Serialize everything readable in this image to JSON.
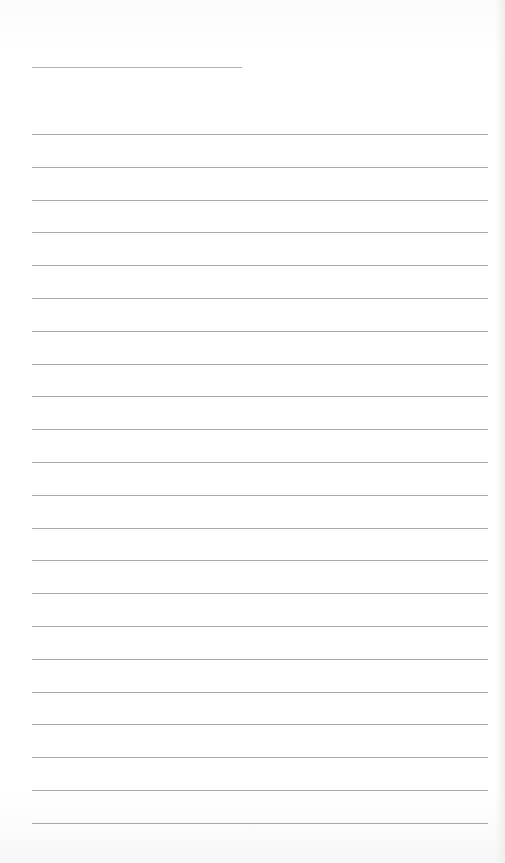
{
  "document": {
    "type": "lined-paper",
    "header_line": {
      "x": 32,
      "y": 67,
      "width": 210
    },
    "ruled_lines": {
      "count": 22,
      "x": 32,
      "width": 456,
      "first_y": 134,
      "spacing": 32.8
    },
    "colors": {
      "paper": "#ffffff",
      "rule": "#a9a9a9"
    }
  }
}
